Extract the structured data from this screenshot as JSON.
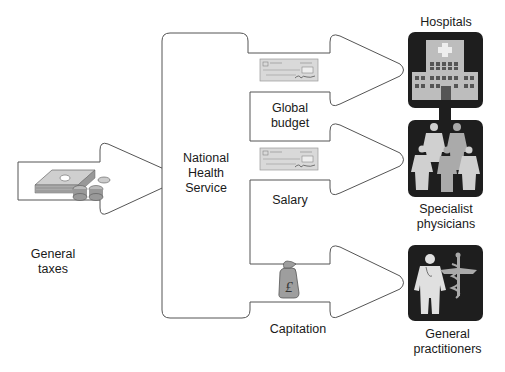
{
  "source": {
    "label_line1": "General",
    "label_line2": "taxes",
    "icon": "money-icon"
  },
  "hub": {
    "label_line1": "National",
    "label_line2": "Health",
    "label_line3": "Service"
  },
  "flows": [
    {
      "label_line1": "Global",
      "label_line2": "budget",
      "icon": "cheque-icon",
      "target": "Hospitals"
    },
    {
      "label_line1": "Salary",
      "label_line2": "",
      "icon": "cheque-icon",
      "target": "Specialist physicians"
    },
    {
      "label_line1": "Capitation",
      "label_line2": "",
      "icon": "pound-moneybag-icon",
      "target": "General practitioners"
    }
  ],
  "recipients": [
    {
      "label_line1": "Hospitals",
      "label_line2": "",
      "icon": "hospital-icon"
    },
    {
      "label_line1": "Specialist",
      "label_line2": "physicians",
      "icon": "physicians-group-icon"
    },
    {
      "label_line1": "General",
      "label_line2": "practitioners",
      "icon": "doctor-caduceus-icon"
    }
  ],
  "symbols": {
    "pound": "£"
  },
  "colors": {
    "outline": "#555555",
    "icon_bg": "#1e1e1e",
    "icon_fg": "#bdbdbd",
    "cheque": "#d6d6d6",
    "bag": "#9a9a9a"
  }
}
